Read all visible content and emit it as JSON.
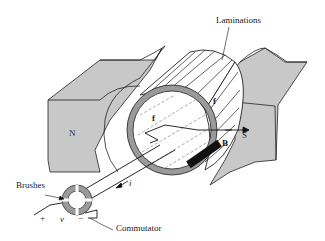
{
  "diagram": {
    "labels": {
      "laminations": "Laminations",
      "brushes": "Brushes",
      "commutator": "Commutator",
      "north_pole": "N",
      "south_pole": "S",
      "field": "B",
      "current": "i",
      "voltage": "v",
      "plus": "+",
      "minus": "−",
      "force_left": "f",
      "force_right": "f"
    },
    "colors": {
      "pole_fill": "#c8c8c8",
      "ring_fill": "#9a9a9a",
      "line": "#1a1a1a",
      "brush_fill": "#111111",
      "background": "#ffffff"
    }
  }
}
